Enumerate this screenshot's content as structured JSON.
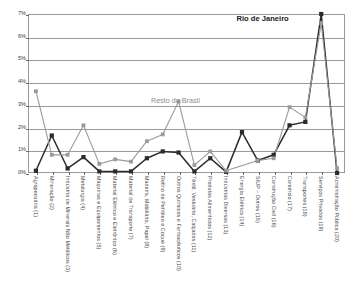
{
  "chart_data": {
    "type": "line",
    "title": "",
    "xlabel": "",
    "ylabel": "",
    "ylim": [
      0,
      7
    ],
    "ytick_labels": [
      "0%",
      "1%",
      "2%",
      "3%",
      "4%",
      "5%",
      "6%",
      "7%"
    ],
    "ytick_values": [
      0,
      1,
      2,
      3,
      4,
      5,
      6,
      7
    ],
    "grid": true,
    "legend": "inline-annotations",
    "categories": [
      "Agropecuária (1)",
      "Mineração (2)",
      "Indústria de Minerais Não Metálicos (3)",
      "Metalurgia (4)",
      "Máquinas e Equipamentos (5)",
      "Material Elétrico e Eletrônico (6)",
      "Material de Transporte (7)",
      "Madeira, Mobiliário, Papel (8)",
      "Refino de Petróleo e Coque (9)",
      "Outros Químicos e Farmacêuticos (10)",
      "Têxtil, Vestuário, Calçados (11)",
      "Produtos Alimentícios (12)",
      "Indústrias Diversas (13)",
      "Energia Elétrica (14)",
      "SIUP – Outros (15)",
      "Construção Civil (16)",
      "Comércio (17)",
      "Transportes (18)",
      "Serviços Privados (19)",
      "Administração Pública (20)"
    ],
    "series": [
      {
        "name": "Rio de Janeiro",
        "color": "#2b2b2b",
        "marker": "square",
        "values": [
          0.1,
          1.65,
          0.2,
          0.7,
          0.07,
          0.07,
          0.07,
          0.65,
          0.95,
          0.9,
          0.07,
          0.65,
          0.05,
          1.8,
          0.55,
          0.8,
          2.1,
          2.25,
          7.0,
          0.0
        ]
      },
      {
        "name": "Resto do Brasil",
        "color": "#9a9a9a",
        "marker": "square",
        "values": [
          3.6,
          0.8,
          0.8,
          2.1,
          0.4,
          0.6,
          0.5,
          1.4,
          1.7,
          3.15,
          0.35,
          0.95,
          0.1,
          null,
          0.55,
          0.65,
          2.9,
          2.45,
          6.6,
          0.2
        ]
      }
    ],
    "annotations": [
      {
        "text": "Rio de Janeiro",
        "series": "Rio de Janeiro",
        "color": "#1a1a1a",
        "x_pct": 74.0,
        "y_pct": 3.0
      },
      {
        "text": "Resto do Brasil",
        "series": "Resto do Brasil",
        "color": "#8c8c8c",
        "x_pct": 46.5,
        "y_pct": 55.0
      }
    ]
  },
  "colors": {
    "series_rio": "#2b2b2b",
    "series_brasil": "#9a9a9a",
    "gridline": "#9a9a9a",
    "axis_text": "#3a3a3a",
    "background": "#ffffff"
  }
}
